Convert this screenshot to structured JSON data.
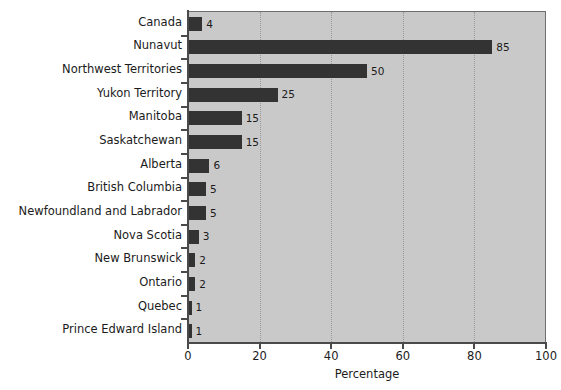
{
  "chart_data": {
    "type": "bar",
    "orientation": "horizontal",
    "title": "",
    "xlabel": "Percentage",
    "ylabel": "",
    "xlim": [
      0,
      100
    ],
    "xticks": [
      "0",
      "20",
      "40",
      "60",
      "80",
      "100"
    ],
    "grid": "vertical-dotted",
    "legend": "none",
    "bar_color": "#333333",
    "plot_background": "#c9c9c9",
    "categories": [
      "Canada",
      "Nunavut",
      "Northwest Territories",
      "Yukon Territory",
      "Manitoba",
      "Saskatchewan",
      "Alberta",
      "British Columbia",
      "Newfoundland and Labrador",
      "Nova Scotia",
      "New Brunswick",
      "Ontario",
      "Quebec",
      "Prince Edward Island"
    ],
    "values": [
      4,
      85,
      50,
      25,
      15,
      15,
      6,
      5,
      5,
      3,
      2,
      2,
      1,
      1
    ],
    "value_labels": [
      "4",
      "85",
      "50",
      "25",
      "15",
      "15",
      "6",
      "5",
      "5",
      "3",
      "2",
      "2",
      "1",
      "1"
    ]
  }
}
